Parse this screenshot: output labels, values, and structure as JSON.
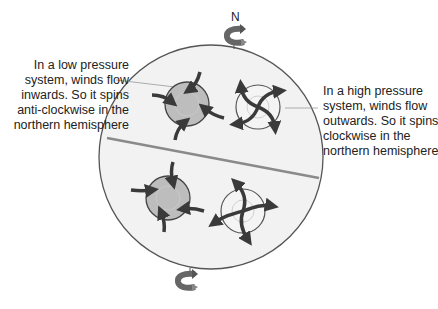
{
  "diagram": {
    "north_label": "N",
    "low_pressure_annotation": [
      "In a low pressure",
      "system, winds flow",
      "inwards. So it spins",
      "anti-clockwise in the",
      "northern hemisphere"
    ],
    "high_pressure_annotation": [
      "In a high pressure",
      "system, winds flow",
      "outwards. So it spins",
      "clockwise in the",
      "northern hemisphere"
    ],
    "colors": {
      "globe_fill": "#f2f2f2",
      "globe_stroke": "#555555",
      "equator": "#8a8a8a",
      "low_fill": "#bdbdbd",
      "high_fill": "#f4f4f4",
      "arrow": "#3a3a3a",
      "spin_arrow": "#6e6e6e"
    }
  }
}
